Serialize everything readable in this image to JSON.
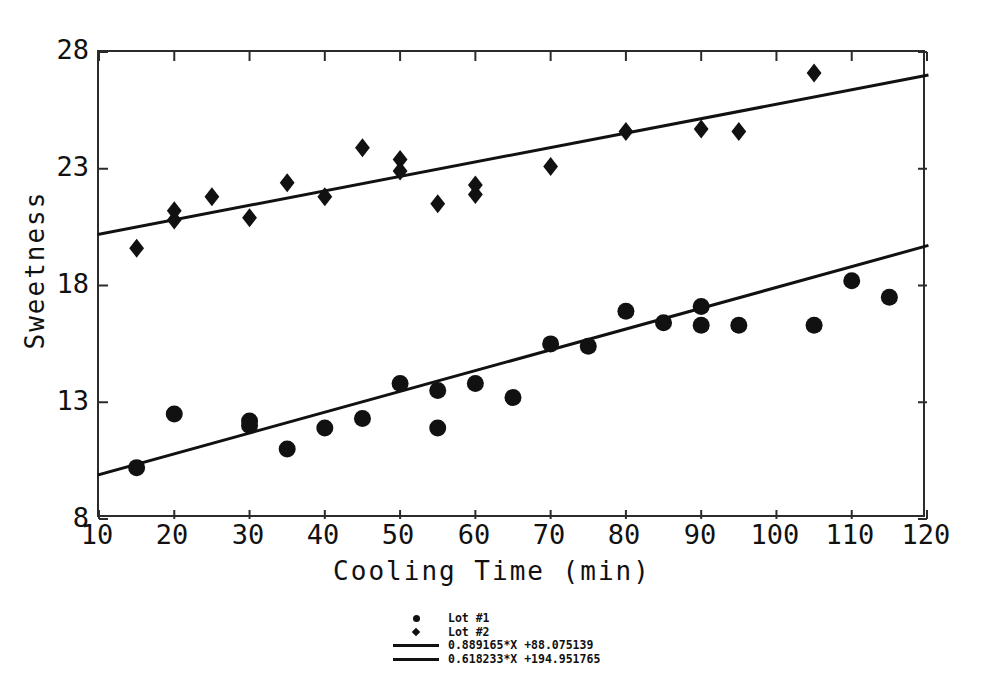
{
  "chart_data": {
    "type": "scatter",
    "title": "",
    "xlabel": "Cooling Time (min)",
    "ylabel": "Sweetness",
    "xlim": [
      10,
      120
    ],
    "ylim": [
      8,
      28
    ],
    "xticks": [
      10,
      20,
      30,
      40,
      50,
      60,
      70,
      80,
      90,
      100,
      110,
      120
    ],
    "yticks": [
      8,
      13,
      18,
      23,
      28
    ],
    "grid": false,
    "legend_position": "below-center",
    "marker_color": "#111111",
    "line_color": "#111111",
    "series": [
      {
        "name": "Lot #1",
        "marker": "circle",
        "x": [
          15,
          20,
          30,
          30,
          35,
          40,
          45,
          50,
          55,
          55,
          60,
          65,
          70,
          75,
          80,
          85,
          90,
          90,
          95,
          105,
          110,
          115
        ],
        "y": [
          10.2,
          12.5,
          12.2,
          12.0,
          11.0,
          11.9,
          12.3,
          13.8,
          13.5,
          11.9,
          13.8,
          13.2,
          15.5,
          15.4,
          16.9,
          16.4,
          17.1,
          16.3,
          16.3,
          16.3,
          18.2,
          17.5
        ]
      },
      {
        "name": "Lot #2",
        "marker": "diamond",
        "x": [
          15,
          20,
          20,
          25,
          30,
          35,
          40,
          45,
          50,
          50,
          55,
          60,
          60,
          70,
          80,
          90,
          95,
          105
        ],
        "y": [
          19.6,
          21.2,
          20.8,
          21.8,
          20.9,
          22.4,
          21.8,
          23.9,
          23.4,
          22.9,
          21.5,
          22.3,
          21.9,
          23.1,
          24.6,
          24.7,
          24.6,
          27.1
        ]
      }
    ],
    "fit_lines": [
      {
        "label": "0.889165*X +88.075139",
        "slope_per_100": 0.889165,
        "intercept_scaled": 88.075139,
        "series": "Lot #1",
        "endpoints": [
          [
            10,
            9.9
          ],
          [
            120,
            19.7
          ]
        ]
      },
      {
        "label": "0.618233*X +194.951765",
        "slope_per_100": 0.618233,
        "intercept_scaled": 194.951765,
        "series": "Lot #2",
        "endpoints": [
          [
            10,
            20.2
          ],
          [
            120,
            27.0
          ]
        ]
      }
    ]
  },
  "axes": {
    "x_title": "Cooling Time (min)",
    "y_title": "Sweetness",
    "x_tick_labels": [
      "10",
      "20",
      "30",
      "40",
      "50",
      "60",
      "70",
      "80",
      "90",
      "100",
      "110",
      "120"
    ],
    "y_tick_labels": [
      "8",
      "13",
      "18",
      "23",
      "28"
    ]
  },
  "legend": {
    "entries": [
      {
        "key": "circle-marker-icon",
        "label": "Lot #1"
      },
      {
        "key": "diamond-marker-icon",
        "label": "Lot #2"
      },
      {
        "key": "line-swatch-icon",
        "label": "0.889165*X +88.075139"
      },
      {
        "key": "line-swatch-icon",
        "label": "0.618233*X +194.951765"
      }
    ]
  }
}
